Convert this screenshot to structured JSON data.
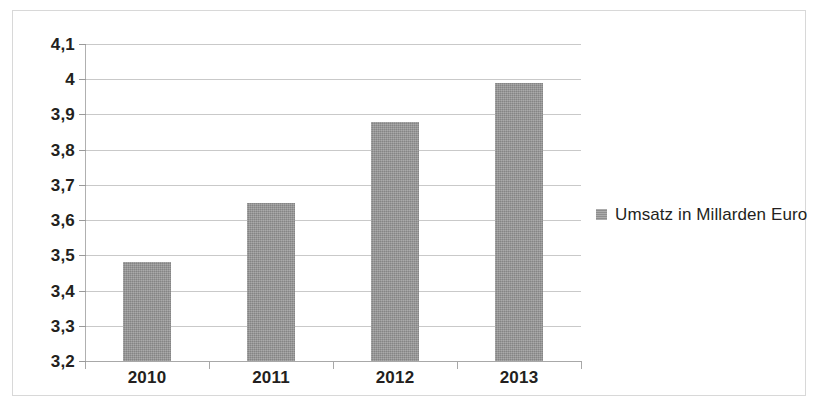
{
  "chart_data": {
    "type": "bar",
    "title": "",
    "subtitle": "",
    "xlabel": "",
    "ylabel": "",
    "categories": [
      "2010",
      "2011",
      "2012",
      "2013"
    ],
    "values": [
      3.48,
      3.65,
      3.88,
      3.99
    ],
    "series": [
      {
        "name": "Umsatz in Millarden Euro",
        "values": [
          3.48,
          3.65,
          3.88,
          3.99
        ]
      }
    ],
    "ylim": [
      3.2,
      4.1
    ],
    "ytick_step": 0.1,
    "ytick_labels": [
      "4,1",
      "4",
      "3,9",
      "3,8",
      "3,7",
      "3,6",
      "3,5",
      "3,4",
      "3,3",
      "3,2"
    ],
    "ytick_values": [
      4.1,
      4.0,
      3.9,
      3.8,
      3.7,
      3.6,
      3.5,
      3.4,
      3.3,
      3.2
    ],
    "grid": true,
    "legend_position": "right",
    "legend": [
      "Umsatz in Millarden Euro"
    ],
    "decimal_separator": ",",
    "annotations": []
  },
  "legend": {
    "label": "Umsatz in Millarden Euro",
    "swatch_color": "#9a9a9a"
  },
  "colors": {
    "bar": "#949494",
    "gridline": "#c9c9c9",
    "axis": "#a8a8a8",
    "frame": "#d8d8d8",
    "text": "#231f20",
    "background": "#ffffff"
  }
}
